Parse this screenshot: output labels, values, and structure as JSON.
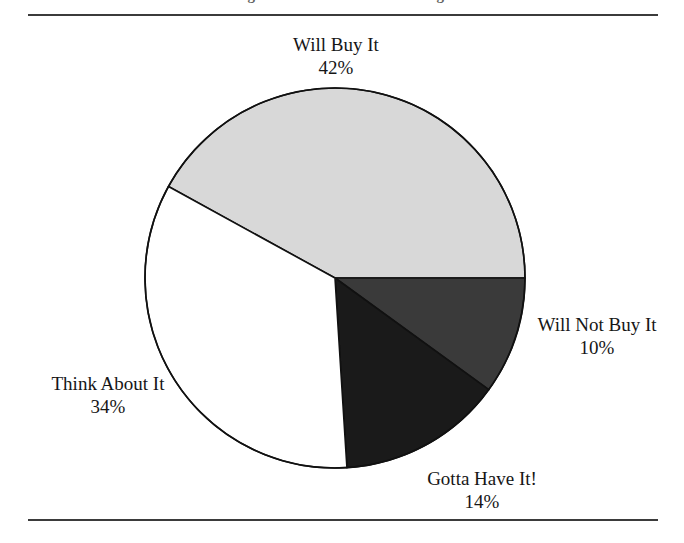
{
  "figure": {
    "caption": "Figure 1.  Purchase Intent Ratings",
    "background_color": "#ffffff",
    "rule_color": "#3b3b3b"
  },
  "chart_data": {
    "type": "pie",
    "title": "",
    "categories": [
      "Will Buy It",
      "Will Not Buy It",
      "Gotta Have It!",
      "Think About It"
    ],
    "values": [
      42,
      10,
      14,
      34
    ],
    "value_labels": [
      "42%",
      "10%",
      "14%",
      "34%"
    ],
    "unit": "%",
    "start_angle_deg": 0,
    "direction": "clockwise",
    "legend": "none",
    "grid": false,
    "slices": [
      {
        "label": "Will Buy It",
        "value": 42,
        "value_label": "42%",
        "color": "#d8d8d8",
        "start_deg": 208.8,
        "end_deg": 360.0
      },
      {
        "label": "Will Not Buy It",
        "value": 10,
        "value_label": "10%",
        "color": "#3a3a3a",
        "start_deg": 0.0,
        "end_deg": 36.0
      },
      {
        "label": "Gotta Have It!",
        "value": 14,
        "value_label": "14%",
        "color": "#1a1a1a",
        "start_deg": 36.0,
        "end_deg": 86.4
      },
      {
        "label": "Think About It",
        "value": 34,
        "value_label": "34%",
        "color": "#ffffff",
        "start_deg": 86.4,
        "end_deg": 208.8
      }
    ],
    "outline_color": "#111111",
    "center": {
      "x": 335,
      "y": 278
    },
    "radius": 190
  }
}
